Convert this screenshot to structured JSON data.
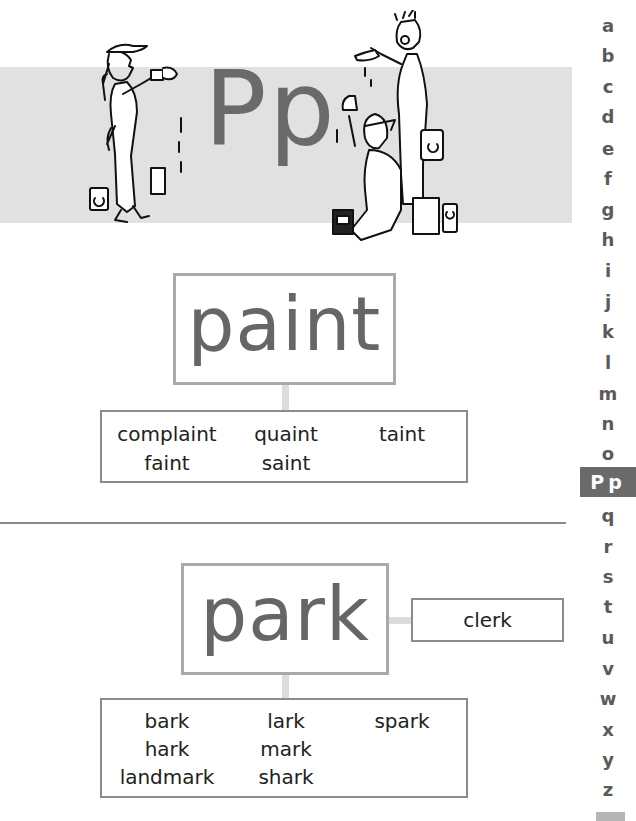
{
  "header": {
    "letter": "Pp",
    "band_color": "#e1e1e1",
    "illustration": "painters-illustration"
  },
  "entries": [
    {
      "headword": "paint",
      "related_words": [
        [
          "complaint",
          "quaint",
          "taint"
        ],
        [
          "faint",
          "saint",
          ""
        ]
      ]
    },
    {
      "headword": "park",
      "side_word": "clerk",
      "related_words": [
        [
          "bark",
          "lark",
          "spark"
        ],
        [
          "hark",
          "mark",
          ""
        ],
        [
          "landmark",
          "shark",
          ""
        ]
      ]
    }
  ],
  "alphabet_index": {
    "letters": [
      "a",
      "b",
      "c",
      "d",
      "e",
      "f",
      "g",
      "h",
      "i",
      "j",
      "k",
      "l",
      "m",
      "n",
      "o",
      "Pp",
      "q",
      "r",
      "s",
      "t",
      "u",
      "v",
      "w",
      "x",
      "y",
      "z"
    ],
    "active": "Pp",
    "active_color": "#6a6a6a"
  },
  "colors": {
    "headword": "#666666",
    "box_border": "#a9a9a9",
    "connector": "#dcdcdc"
  }
}
